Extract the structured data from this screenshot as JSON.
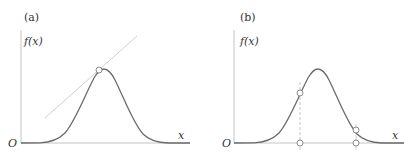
{
  "panels": [
    {
      "id": "a",
      "label": "(a)",
      "y_axis_label": "f(x)",
      "x_axis_label": "x",
      "origin_label": "O",
      "description": "Bell-shaped curve with a tangent line touching at a point on the rising side near the peak"
    },
    {
      "id": "b",
      "label": "(b)",
      "y_axis_label": "f(x)",
      "x_axis_label": "x",
      "origin_label": "O",
      "description": "Bell-shaped curve with two marked points and their projections onto the x-axis; dashed vertical line at the left point"
    }
  ],
  "colors": {
    "curve": "#6b6b6b",
    "axis": "#bdbdbd",
    "tangent": "#c8c8c8",
    "marker_fill": "#ffffff",
    "marker_stroke": "#8a8a8a",
    "text": "#333333"
  }
}
